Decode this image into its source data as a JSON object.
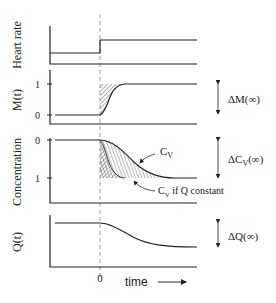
{
  "panels": [
    {
      "id": "heart-rate",
      "ylabel": "Heart rate"
    },
    {
      "id": "m",
      "ylabel": "M(t)",
      "ticks": [
        "1",
        "0"
      ],
      "delta_label": "ΔM(∞)"
    },
    {
      "id": "concentration",
      "ylabel": "Concentration",
      "ticks": [
        "0",
        "1"
      ],
      "delta_label": "ΔC",
      "delta_sub": "V",
      "delta_suffix": "(∞)",
      "annotations": [
        {
          "main": "C",
          "sub": "V",
          "suffix": ""
        },
        {
          "main": "C",
          "sub": "V",
          "suffix": " if Q constant"
        }
      ]
    },
    {
      "id": "q",
      "ylabel": "Q(t)",
      "delta_label": "ΔQ(∞)"
    }
  ],
  "xaxis": {
    "zero_label": "0",
    "label": "time",
    "arrow": "arrow-right"
  },
  "colors": {
    "line": "#222222",
    "hatch": "#333333",
    "dash": "#888888"
  }
}
